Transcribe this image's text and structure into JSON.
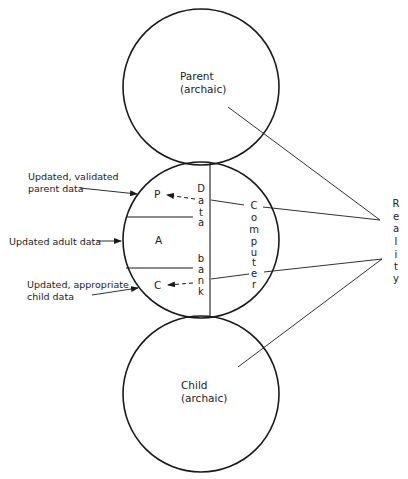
{
  "diagram": {
    "parent_circle": {
      "line1": "Parent",
      "line2": "(archaic)"
    },
    "child_circle": {
      "line1": "Child",
      "line2": "(archaic)"
    },
    "adult_circle": {
      "regions": {
        "parent": "P",
        "adult": "A",
        "child": "C"
      },
      "data_bank": {
        "word1": [
          "D",
          "a",
          "t",
          "a"
        ],
        "word2": [
          "b",
          "a",
          "n",
          "k"
        ]
      },
      "computer": [
        "C",
        "o",
        "m",
        "p",
        "u",
        "t",
        "e",
        "r"
      ]
    },
    "inputs": {
      "parent": {
        "line1": "Updated, validated",
        "line2": "parent data"
      },
      "adult": {
        "line1": "Updated adult data"
      },
      "child": {
        "line1": "Updated, appropriate",
        "line2": "child data"
      }
    },
    "reality": [
      "R",
      "e",
      "a",
      "l",
      "i",
      "t",
      "y"
    ],
    "colors": {
      "stroke": "#1a1a1a",
      "text": "#222222",
      "background": "#ffffff"
    }
  }
}
